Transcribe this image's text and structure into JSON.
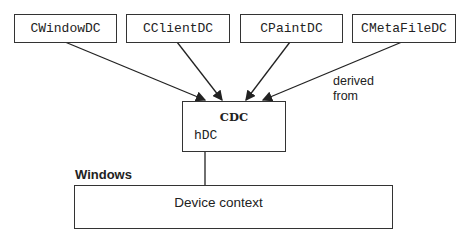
{
  "derived_classes": [
    {
      "label": "CWindowDC"
    },
    {
      "label": "CClientDC"
    },
    {
      "label": "CPaintDC"
    },
    {
      "label": "CMetaFileDC"
    }
  ],
  "base_class": {
    "title": "CDC",
    "member": "hDC"
  },
  "relationship_label": "derived\nfrom",
  "windows": {
    "section_label": "Windows",
    "object_label": "Device context"
  }
}
